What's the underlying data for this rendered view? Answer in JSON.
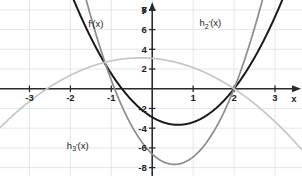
{
  "chart_data": {
    "type": "line",
    "title": "",
    "xlabel": "x",
    "ylabel": "y",
    "xlim": [
      -3.72,
      3.66
    ],
    "ylim": [
      -8.85,
      9.0
    ],
    "grid": true,
    "grid_x": [
      -3,
      -2,
      -1,
      0,
      1,
      2,
      3
    ],
    "grid_y": [
      -8,
      -6,
      -4,
      -2,
      0,
      2,
      4,
      6,
      8
    ],
    "x_ticks": [
      -3,
      -2,
      -1,
      1,
      2,
      3
    ],
    "x_tick_labels": [
      "-3",
      "-2",
      "-1",
      "1",
      "2",
      "3"
    ],
    "y_ticks": [
      -8,
      -6,
      -4,
      -2,
      2,
      4,
      6,
      8
    ],
    "y_tick_labels": [
      "-8",
      "-6",
      "-4",
      "-2",
      "2",
      "4",
      "6",
      "8"
    ],
    "legend": "inline-labels",
    "series": [
      {
        "name": "f'(x)",
        "label_base": "f",
        "label_prime": "′",
        "label_sub": "",
        "label_tail": "(x)",
        "color": "#1a1a1a",
        "width": 2.0,
        "kind": "parabola",
        "a": 1.95,
        "roots": [
          -0.74,
          2.0
        ],
        "vertex": [
          0.63,
          -2.72
        ],
        "label_xy": [
          -1.38,
          6.3
        ]
      },
      {
        "name": "h2'(x)",
        "label_base": "h",
        "label_prime": "′",
        "label_sub": "2",
        "label_tail": "(x)",
        "color": "#8c8c8c",
        "width": 1.7,
        "kind": "parabola",
        "a": 3.6,
        "roots": [
          -0.92,
          2.0
        ],
        "vertex": [
          0.54,
          -5.2
        ],
        "label_xy": [
          1.42,
          6.35
        ]
      },
      {
        "name": "h3'(x)",
        "label_base": "h",
        "label_prime": "′",
        "label_sub": "3",
        "label_tail": "(x)",
        "color": "#c6c6c6",
        "width": 1.7,
        "kind": "parabola",
        "a": -0.6,
        "roots": [
          -2.57,
          2.0
        ],
        "vertex": [
          -0.285,
          1.3
        ],
        "label_xy": [
          -1.82,
          -6.1
        ]
      }
    ]
  },
  "axes": {
    "x_axis_label": "x",
    "y_axis_label": "y"
  },
  "artifact": {
    "top_clipped_text": ""
  }
}
